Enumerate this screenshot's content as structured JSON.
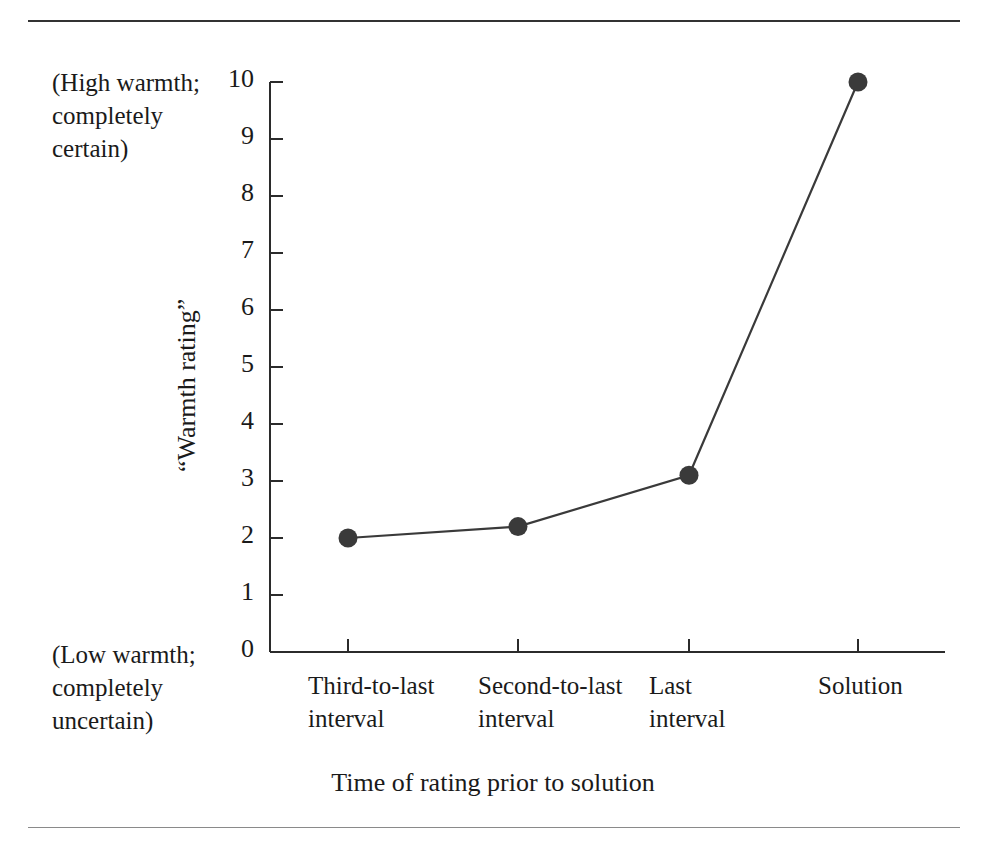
{
  "figure": {
    "background_color": "#ffffff",
    "ink_color": "#2b2b2b",
    "top_rule_color": "#333333",
    "bottom_rule_color": "#8a8a8a"
  },
  "annotations": {
    "high_end_note": "(High warmth;\ncompletely\ncertain)",
    "low_end_note": "(Low warmth;\ncompletely\nuncertain)"
  },
  "chart_data": {
    "type": "line",
    "title": "",
    "subtitle": "",
    "xlabel": "Time of rating prior to solution",
    "ylabel": "“Warmth rating”",
    "categories": [
      "Third-to-last\ninterval",
      "Second-to-last\ninterval",
      "Last\ninterval",
      "Solution"
    ],
    "values": [
      2.0,
      2.2,
      3.1,
      10.0
    ],
    "ylim": [
      0,
      10
    ],
    "yticks": [
      0,
      1,
      2,
      3,
      4,
      5,
      6,
      7,
      8,
      9,
      10
    ],
    "ytick_labels": [
      "0",
      "1",
      "2",
      "3",
      "4",
      "5",
      "6",
      "7",
      "8",
      "9",
      "10"
    ],
    "grid": false,
    "legend": false,
    "legend_position": "none",
    "marker": "filled-circle",
    "marker_color": "#3a3a3a",
    "line_color": "#3a3a3a",
    "axis_note_high": "(High warmth; completely certain)",
    "axis_note_low": "(Low warmth; completely uncertain)"
  },
  "geometry": {
    "axis_left_x": 270,
    "axis_right_x": 945,
    "axis_top_y": 82,
    "axis_bottom_y": 652,
    "unit_px": 57,
    "tick_len": 13,
    "xtick_px": [
      348,
      518,
      689,
      858
    ],
    "point_px": [
      {
        "x": 348,
        "y": 538
      },
      {
        "x": 518,
        "y": 525
      },
      {
        "x": 689,
        "y": 473
      },
      {
        "x": 858,
        "y": 82
      }
    ]
  }
}
